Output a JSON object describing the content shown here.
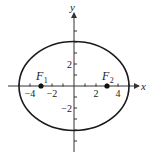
{
  "diagram": {
    "type": "ellipse-with-foci",
    "axes": {
      "x_label": "x",
      "y_label": "y",
      "x_ticks": [
        -5,
        -4,
        -3,
        -2,
        -1,
        1,
        2,
        3,
        4,
        5
      ],
      "y_ticks": [
        -5,
        -4,
        -3,
        -2,
        -1,
        1,
        2,
        3,
        4,
        5
      ],
      "x_tick_labels": [
        {
          "value": -4,
          "text": "−4"
        },
        {
          "value": -2,
          "text": "−2"
        },
        {
          "value": 2,
          "text": "2"
        },
        {
          "value": 4,
          "text": "4"
        }
      ],
      "y_tick_labels": [
        {
          "value": 2,
          "text": "2"
        },
        {
          "value": -2,
          "text": "−2"
        }
      ]
    },
    "ellipse": {
      "center": [
        0,
        0
      ],
      "semi_major_x": 5,
      "semi_minor_y": 4,
      "stroke_color": "#1a1a1a"
    },
    "foci": [
      {
        "name": "F",
        "subscript": "1",
        "x": -3,
        "y": 0
      },
      {
        "name": "F",
        "subscript": "2",
        "x": 3,
        "y": 0
      }
    ],
    "colors": {
      "axis": "#333333",
      "point": "#111111",
      "text": "#222222"
    }
  }
}
